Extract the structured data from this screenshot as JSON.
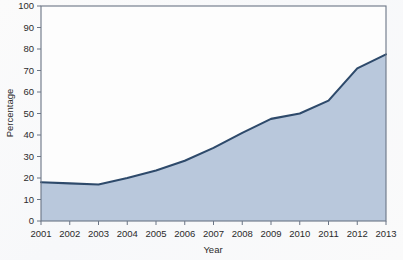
{
  "chart_data": {
    "type": "area",
    "title": "",
    "xlabel": "Year",
    "ylabel": "Percentage",
    "categories": [
      "2001",
      "2002",
      "2003",
      "2004",
      "2005",
      "2006",
      "2007",
      "2008",
      "2009",
      "2010",
      "2011",
      "2012",
      "2013"
    ],
    "x": [
      2001,
      2002,
      2003,
      2004,
      2005,
      2006,
      2007,
      2008,
      2009,
      2010,
      2011,
      2012,
      2013
    ],
    "values": [
      18,
      17.5,
      17,
      20,
      23.5,
      28,
      34,
      41,
      47.5,
      50,
      56,
      71,
      77.5
    ],
    "series": [
      {
        "name": "Percentage",
        "values": [
          18,
          17.5,
          17,
          20,
          23.5,
          28,
          34,
          41,
          47.5,
          50,
          56,
          71,
          77.5
        ]
      }
    ],
    "xlim": [
      2001,
      2013
    ],
    "ylim": [
      0,
      100
    ],
    "ytick_labels": [
      "0",
      "10",
      "20",
      "30",
      "40",
      "50",
      "60",
      "70",
      "80",
      "90",
      "100"
    ],
    "ytick_values": [
      0,
      10,
      20,
      30,
      40,
      50,
      60,
      70,
      80,
      90,
      100
    ],
    "xtick_labels": [
      "2001",
      "2002",
      "2003",
      "2004",
      "2005",
      "2006",
      "2007",
      "2008",
      "2009",
      "2010",
      "2011",
      "2012",
      "2013"
    ],
    "grid": false,
    "legend": "none",
    "colors": {
      "area_fill": "#b9c8dc",
      "line": "#2e4a6b",
      "axis": "#6b7585",
      "text": "#2b2b2b",
      "background": "#fdfdfd"
    }
  }
}
